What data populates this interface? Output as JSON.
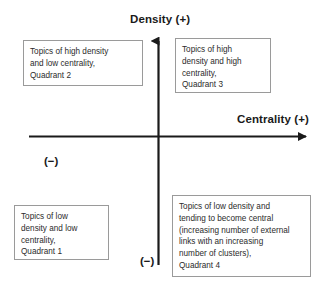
{
  "diagram": {
    "background_color": "#ffffff",
    "axis_color": "#1a1a1a",
    "box_border_color": "#9a9a9a",
    "text_color": "#2b2b2b"
  },
  "axes": {
    "vertical": {
      "label": "Density (+)",
      "negative_marker": "(−)",
      "direction": "up"
    },
    "horizontal": {
      "label": "Centrality (+)",
      "negative_marker": "(−)",
      "direction": "right"
    }
  },
  "quadrants": [
    {
      "id": "quadrant-2",
      "position": "upper-left",
      "text": "Topics of high density\nand low centrality,\nQuadrant 2"
    },
    {
      "id": "quadrant-3",
      "position": "upper-right",
      "text": "Topics of high\ndensity and high\ncentrality,\nQuadrant 3"
    },
    {
      "id": "quadrant-1",
      "position": "lower-left",
      "text": "Topics of low\ndensity and low\ncentrality,\nQuadrant 1"
    },
    {
      "id": "quadrant-4",
      "position": "lower-right",
      "text": "Topics of low density and\ntending to become central\n(increasing number of external\nlinks with an increasing\nnumber of clusters),\nQuadrant 4"
    }
  ]
}
